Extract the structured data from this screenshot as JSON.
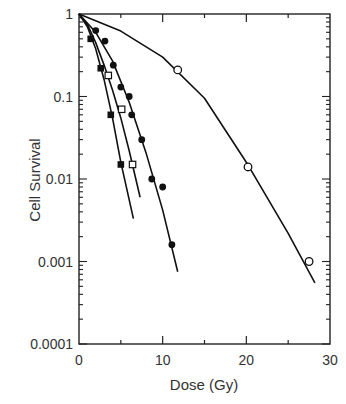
{
  "chart_data": {
    "type": "scatter",
    "title": "",
    "xlabel": "Dose (Gy)",
    "ylabel": "Cell Survival",
    "xlim": [
      0,
      30
    ],
    "ylim": [
      0.0001,
      1
    ],
    "yscale": "log",
    "grid": false,
    "legend": "none",
    "x_ticks": [
      "0",
      "10",
      "20",
      "30"
    ],
    "y_ticks": [
      "1",
      "0.1",
      "0.01",
      "0.001",
      "0.0001"
    ],
    "series": [
      {
        "name": "filled-squares",
        "marker": "filled-square",
        "points": [
          [
            1.4,
            0.5
          ],
          [
            2.6,
            0.22
          ],
          [
            3.8,
            0.06
          ],
          [
            5.0,
            0.015
          ]
        ],
        "fit_curve": [
          [
            0,
            1
          ],
          [
            1,
            0.7
          ],
          [
            2,
            0.38
          ],
          [
            3,
            0.16
          ],
          [
            4,
            0.055
          ],
          [
            5,
            0.016
          ],
          [
            6.5,
            0.0033
          ]
        ]
      },
      {
        "name": "open-squares",
        "marker": "open-square",
        "points": [
          [
            3.5,
            0.18
          ],
          [
            5.1,
            0.07
          ],
          [
            6.4,
            0.015
          ]
        ],
        "fit_curve": [
          [
            0,
            1
          ],
          [
            1,
            0.75
          ],
          [
            2,
            0.45
          ],
          [
            3,
            0.24
          ],
          [
            4,
            0.12
          ],
          [
            5,
            0.055
          ],
          [
            6,
            0.022
          ],
          [
            7.3,
            0.006
          ]
        ]
      },
      {
        "name": "filled-circles",
        "marker": "filled-circle",
        "points": [
          [
            2.0,
            0.63
          ],
          [
            3.1,
            0.47
          ],
          [
            4.1,
            0.24
          ],
          [
            5.0,
            0.13
          ],
          [
            6.0,
            0.1
          ],
          [
            6.3,
            0.06
          ],
          [
            7.5,
            0.03
          ],
          [
            8.7,
            0.01
          ],
          [
            10.0,
            0.008
          ],
          [
            11.1,
            0.0016
          ]
        ],
        "fit_curve": [
          [
            0,
            1
          ],
          [
            2,
            0.6
          ],
          [
            4,
            0.27
          ],
          [
            6,
            0.085
          ],
          [
            8,
            0.021
          ],
          [
            10,
            0.0042
          ],
          [
            11.8,
            0.00075
          ]
        ]
      },
      {
        "name": "open-circles",
        "marker": "open-circle",
        "points": [
          [
            11.8,
            0.21
          ],
          [
            20.2,
            0.014
          ],
          [
            27.5,
            0.001
          ]
        ],
        "fit_curve": [
          [
            0,
            1
          ],
          [
            5,
            0.62
          ],
          [
            10,
            0.3
          ],
          [
            15,
            0.095
          ],
          [
            20,
            0.016
          ],
          [
            25,
            0.0022
          ],
          [
            28.2,
            0.00055
          ]
        ]
      }
    ]
  }
}
